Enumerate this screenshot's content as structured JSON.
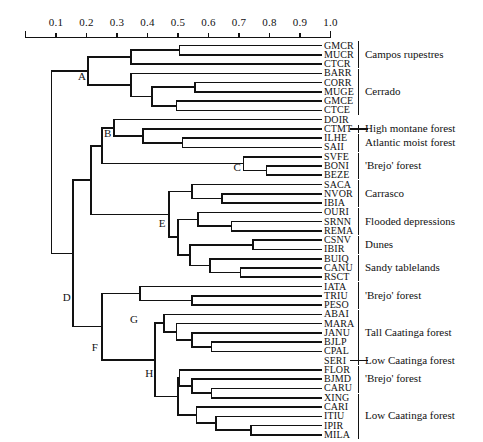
{
  "figure": {
    "type": "dendrogram",
    "axis": {
      "orientation": "top",
      "min": 0.0,
      "max": 1.0,
      "ticks": [
        0.1,
        0.2,
        0.3,
        0.4,
        0.5,
        0.6,
        0.7,
        0.8,
        0.9,
        1.0
      ],
      "tick_labels": [
        "0.1",
        "0.2",
        "0.3",
        "0.4",
        "0.5",
        "0.6",
        "0.7",
        "0.8",
        "0.9",
        "1.0"
      ]
    },
    "node_labels": [
      {
        "id": "A",
        "x": 0.205,
        "y_index": 3.4
      },
      {
        "id": "B",
        "x": 0.29,
        "y_index": 9.6
      },
      {
        "id": "C",
        "x": 0.715,
        "y_index": 13.2
      },
      {
        "id": "D",
        "x": 0.155,
        "y_index": 27.2
      },
      {
        "id": "E",
        "x": 0.47,
        "y_index": 19.3
      },
      {
        "id": "F",
        "x": 0.25,
        "y_index": 32.6
      },
      {
        "id": "G",
        "x": 0.375,
        "y_index": 29.6
      },
      {
        "id": "H",
        "x": 0.425,
        "y_index": 35.4
      }
    ],
    "leaves": [
      "GMCR",
      "MUCR",
      "CTCR",
      "BARR",
      "CORR",
      "MUGE",
      "GMCE",
      "CTCE",
      "DOIR",
      "CTMT",
      "ILHE",
      "SAII",
      "SVFE",
      "BONI",
      "BEZE",
      "SACA",
      "NVOR",
      "IBIA",
      "OURI",
      "SRNN",
      "REMA",
      "CSNV",
      "IBIR",
      "BUIQ",
      "CANU",
      "RSCT",
      "IATA",
      "TRIU",
      "PESO",
      "ABAI",
      "MARA",
      "JANU",
      "BJLP",
      "CPAL",
      "SERI",
      "FLOR",
      "BJMD",
      "CARU",
      "XING",
      "CARI",
      "ITIU",
      "IPIR",
      "MILA"
    ],
    "groups": [
      {
        "label": "Campos rupestres",
        "from": 0,
        "to": 2
      },
      {
        "label": "Cerrado",
        "from": 3,
        "to": 7
      },
      {
        "label": "High montane forest",
        "from": 9,
        "to": 9
      },
      {
        "label": "Atlantic moist forest",
        "from": 10,
        "to": 11
      },
      {
        "label": "'Brejo' forest",
        "from": 12,
        "to": 14
      },
      {
        "label": "Carrasco",
        "from": 15,
        "to": 17
      },
      {
        "label": "Flooded depressions",
        "from": 18,
        "to": 20
      },
      {
        "label": "Dunes",
        "from": 21,
        "to": 22
      },
      {
        "label": "Sandy tablelands",
        "from": 23,
        "to": 25
      },
      {
        "label": "'Brejo' forest",
        "from": 26,
        "to": 28
      },
      {
        "label": "Tall Caatinga forest",
        "from": 29,
        "to": 33
      },
      {
        "label": "Low Caatinga forest",
        "from": 34,
        "to": 34
      },
      {
        "label": "'Brejo' forest",
        "from": 35,
        "to": 37
      },
      {
        "label": "Low Caatinga forest",
        "from": 38,
        "to": 42
      }
    ],
    "merges": [
      {
        "name": "m-gmcr-mucr",
        "x": 0.505,
        "children": [
          {
            "leaf": 0
          },
          {
            "leaf": 1
          }
        ]
      },
      {
        "name": "m-cr3",
        "x": 0.345,
        "children": [
          {
            "node": "m-gmcr-mucr"
          },
          {
            "leaf": 2
          }
        ]
      },
      {
        "name": "m-corr-muge",
        "x": 0.555,
        "children": [
          {
            "leaf": 4
          },
          {
            "leaf": 5
          }
        ]
      },
      {
        "name": "m-gmce-ctce",
        "x": 0.495,
        "children": [
          {
            "leaf": 6
          },
          {
            "leaf": 7
          }
        ]
      },
      {
        "name": "m-ce4",
        "x": 0.415,
        "children": [
          {
            "node": "m-corr-muge"
          },
          {
            "node": "m-gmce-ctce"
          }
        ]
      },
      {
        "name": "m-ce5",
        "x": 0.345,
        "children": [
          {
            "leaf": 3
          },
          {
            "node": "m-ce4"
          }
        ]
      },
      {
        "name": "A",
        "x": 0.205,
        "children": [
          {
            "node": "m-cr3"
          },
          {
            "node": "m-ce5"
          }
        ]
      },
      {
        "name": "m-ilhe-saii",
        "x": 0.515,
        "children": [
          {
            "leaf": 10
          },
          {
            "leaf": 11
          }
        ]
      },
      {
        "name": "m-ctmt3",
        "x": 0.385,
        "children": [
          {
            "leaf": 9
          },
          {
            "node": "m-ilhe-saii"
          }
        ]
      },
      {
        "name": "B",
        "x": 0.29,
        "children": [
          {
            "leaf": 8
          },
          {
            "node": "m-ctmt3"
          }
        ]
      },
      {
        "name": "m-boni-beze",
        "x": 0.79,
        "children": [
          {
            "leaf": 13
          },
          {
            "leaf": 14
          }
        ]
      },
      {
        "name": "C",
        "x": 0.715,
        "children": [
          {
            "leaf": 12
          },
          {
            "node": "m-boni-beze"
          }
        ]
      },
      {
        "name": "m-nvor-ibia",
        "x": 0.645,
        "children": [
          {
            "leaf": 16
          },
          {
            "leaf": 17
          }
        ]
      },
      {
        "name": "m-carrasco",
        "x": 0.545,
        "children": [
          {
            "leaf": 15
          },
          {
            "node": "m-nvor-ibia"
          }
        ]
      },
      {
        "name": "m-srnn-rema",
        "x": 0.675,
        "children": [
          {
            "leaf": 19
          },
          {
            "leaf": 20
          }
        ]
      },
      {
        "name": "m-flood",
        "x": 0.565,
        "children": [
          {
            "leaf": 18
          },
          {
            "node": "m-srnn-rema"
          }
        ]
      },
      {
        "name": "m-dunes",
        "x": 0.745,
        "children": [
          {
            "leaf": 21
          },
          {
            "leaf": 22
          }
        ]
      },
      {
        "name": "m-canu-rsct",
        "x": 0.705,
        "children": [
          {
            "leaf": 24
          },
          {
            "leaf": 25
          }
        ]
      },
      {
        "name": "m-sandy",
        "x": 0.605,
        "children": [
          {
            "leaf": 23
          },
          {
            "node": "m-canu-rsct"
          }
        ]
      },
      {
        "name": "m-dun-sandy",
        "x": 0.54,
        "children": [
          {
            "node": "m-dunes"
          },
          {
            "node": "m-sandy"
          }
        ]
      },
      {
        "name": "m-flood2",
        "x": 0.5,
        "children": [
          {
            "node": "m-flood"
          },
          {
            "node": "m-dun-sandy"
          }
        ]
      },
      {
        "name": "E",
        "x": 0.47,
        "children": [
          {
            "node": "m-carrasco"
          },
          {
            "node": "m-flood2"
          }
        ]
      },
      {
        "name": "m-bc",
        "x": 0.25,
        "children": [
          {
            "node": "B"
          },
          {
            "node": "C"
          }
        ]
      },
      {
        "name": "m-triu-peso",
        "x": 0.545,
        "children": [
          {
            "leaf": 27
          },
          {
            "leaf": 28
          }
        ]
      },
      {
        "name": "G",
        "x": 0.375,
        "children": [
          {
            "leaf": 26
          },
          {
            "node": "m-triu-peso"
          }
        ]
      },
      {
        "name": "m-bjlp-cpal",
        "x": 0.61,
        "children": [
          {
            "leaf": 32
          },
          {
            "leaf": 33
          }
        ]
      },
      {
        "name": "m-tall1",
        "x": 0.545,
        "children": [
          {
            "leaf": 31
          },
          {
            "node": "m-bjlp-cpal"
          }
        ]
      },
      {
        "name": "m-tall2",
        "x": 0.495,
        "children": [
          {
            "leaf": 30
          },
          {
            "node": "m-tall1"
          }
        ]
      },
      {
        "name": "m-tall3",
        "x": 0.455,
        "children": [
          {
            "leaf": 29
          },
          {
            "node": "m-tall2"
          }
        ]
      },
      {
        "name": "m-bjmd-caru",
        "x": 0.61,
        "children": [
          {
            "leaf": 37
          },
          {
            "leaf": 38
          }
        ]
      },
      {
        "name": "m-brejo2",
        "x": 0.545,
        "children": [
          {
            "leaf": 36
          },
          {
            "node": "m-bjmd-caru"
          }
        ]
      },
      {
        "name": "m-flor",
        "x": 0.505,
        "children": [
          {
            "leaf": 35
          },
          {
            "node": "m-brejo2"
          }
        ]
      },
      {
        "name": "m-ipir-mila",
        "x": 0.74,
        "children": [
          {
            "leaf": 41
          },
          {
            "leaf": 42
          }
        ]
      },
      {
        "name": "m-itiu",
        "x": 0.625,
        "children": [
          {
            "leaf": 40
          },
          {
            "node": "m-ipir-mila"
          }
        ]
      },
      {
        "name": "m-cari",
        "x": 0.56,
        "children": [
          {
            "leaf": 39
          },
          {
            "node": "m-itiu"
          }
        ]
      },
      {
        "name": "m-low2",
        "x": 0.5,
        "children": [
          {
            "node": "m-flor"
          },
          {
            "node": "m-cari"
          }
        ]
      },
      {
        "name": "H",
        "x": 0.425,
        "children": [
          {
            "node": "m-tall3"
          },
          {
            "node": "m-low2"
          }
        ]
      },
      {
        "name": "F",
        "x": 0.25,
        "children": [
          {
            "node": "G"
          },
          {
            "node": "H"
          }
        ]
      },
      {
        "name": "D",
        "x": 0.155,
        "children": [
          {
            "node": "m-bcE"
          },
          {
            "node": "F"
          }
        ]
      },
      {
        "name": "m-bcE",
        "x": 0.215,
        "children": [
          {
            "node": "m-bc"
          },
          {
            "node": "E"
          }
        ]
      },
      {
        "name": "root",
        "x": 0.085,
        "children": [
          {
            "node": "A"
          },
          {
            "node": "D"
          }
        ]
      }
    ]
  }
}
